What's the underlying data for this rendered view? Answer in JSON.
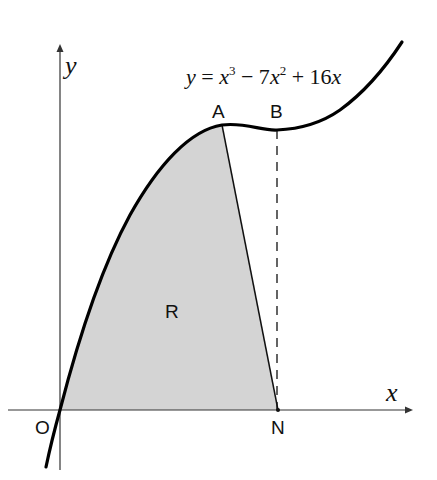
{
  "figure": {
    "equation": {
      "lhs": "y",
      "eq": " = ",
      "t1_var": "x",
      "t1_exp": "3",
      "t2": " − 7",
      "t2_var": "x",
      "t2_exp": "2",
      "t3": " + 16",
      "t3_var": "x"
    },
    "axes": {
      "x_label": "x",
      "y_label": "y"
    },
    "points": {
      "origin": "O",
      "A": "A",
      "B": "B",
      "N": "N"
    },
    "region_label": "R",
    "colors": {
      "curve": "#000000",
      "axes": "#333333",
      "region_fill": "#d4d4d4",
      "background": "#ffffff"
    }
  }
}
